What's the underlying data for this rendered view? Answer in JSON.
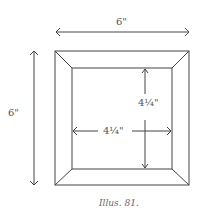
{
  "figure": {
    "caption": "Illus. 81.",
    "top_dimension": "6\"",
    "left_dimension": "6\"",
    "inner_vertical_dimension": "4¼\"",
    "inner_horizontal_dimension": "4¼\""
  },
  "colors": {
    "line": "#444444",
    "text": "#555555",
    "background": "#ffffff"
  }
}
